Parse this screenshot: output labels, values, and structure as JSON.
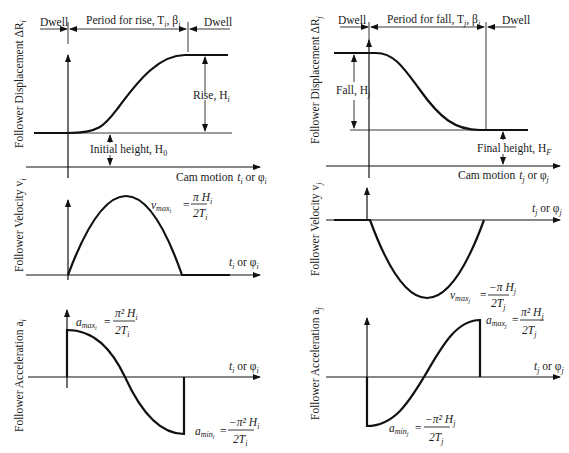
{
  "left": {
    "top_labels": {
      "dwell_left": "Dwell",
      "period": "Period for rise, T",
      "period_sub": "i",
      "period_beta": ", β",
      "period_beta_sub": "i",
      "dwell_right": "Dwell"
    },
    "displacement": {
      "ylabel": "Follower Displacement ΔR",
      "ylabel_sub": "i",
      "rise_label": "Rise, H",
      "rise_sub": "i",
      "initial_label": "Initial height, H",
      "initial_sub": "0",
      "xlabel": "Cam motion",
      "xvar": "t",
      "xvar_sub": "i",
      "xor": " or φ",
      "xor_sub": "i"
    },
    "velocity": {
      "ylabel": "Follower Velocity v",
      "ylabel_sub": "i",
      "xvar": "t",
      "xvar_sub": "i",
      "xor": " or φ",
      "xor_sub": "i",
      "formula_lhs": "v",
      "formula_lhs_sub": "max",
      "formula_lhs_subsub": "i",
      "formula_num": "π H",
      "formula_num_sub": "i",
      "formula_den": "2T",
      "formula_den_sub": "i"
    },
    "acceleration": {
      "ylabel": "Follower Acceleration a",
      "ylabel_sub": "i",
      "xvar": "t",
      "xvar_sub": "i",
      "xor": " or φ",
      "xor_sub": "i",
      "max_lhs": "a",
      "max_lhs_sub": "max",
      "max_lhs_subsub": "i",
      "max_num": "π² H",
      "max_num_sub": "i",
      "max_den": "2T",
      "max_den_sub": "i",
      "min_lhs": "a",
      "min_lhs_sub": "min",
      "min_lhs_subsub": "i",
      "min_num": "−π² H",
      "min_num_sub": "i",
      "min_den": "2T",
      "min_den_sub": "i"
    }
  },
  "right": {
    "top_labels": {
      "dwell_left": "Dwell",
      "period": "Period for fall, T",
      "period_sub": "j",
      "period_beta": ", β",
      "period_beta_sub": "j",
      "dwell_right": "Dwell"
    },
    "displacement": {
      "ylabel": "Follower Displacement ΔR",
      "ylabel_sub": "j",
      "fall_label": "Fall, H",
      "fall_sub": "j",
      "final_label": "Final height, H",
      "final_sub": "F",
      "xlabel": "Cam motion",
      "xvar": "t",
      "xvar_sub": "j",
      "xor": " or φ",
      "xor_sub": "j"
    },
    "velocity": {
      "ylabel": "Follower Velocity v",
      "ylabel_sub": "j",
      "xvar": "t",
      "xvar_sub": "j",
      "xor": " or φ",
      "xor_sub": "j",
      "formula_lhs": "v",
      "formula_lhs_sub": "max",
      "formula_lhs_subsub": "j",
      "formula_num": "−π H",
      "formula_num_sub": "j",
      "formula_den": "2T",
      "formula_den_sub": "j"
    },
    "acceleration": {
      "ylabel": "Follower Acceleration a",
      "ylabel_sub": "j",
      "xvar": "t",
      "xvar_sub": "j",
      "xor": " or φ",
      "xor_sub": "j",
      "max_lhs": "a",
      "max_lhs_sub": "max",
      "max_lhs_subsub": "j",
      "max_num": "π² H",
      "max_num_sub": "j",
      "max_den": "2T",
      "max_den_sub": "j",
      "min_lhs": "a",
      "min_lhs_sub": "min",
      "min_lhs_subsub": "j",
      "min_num": "−π² H",
      "min_num_sub": "j",
      "min_den": "2T",
      "min_den_sub": "j"
    }
  },
  "colors": {
    "ink": "#111111",
    "background": "#ffffff"
  }
}
